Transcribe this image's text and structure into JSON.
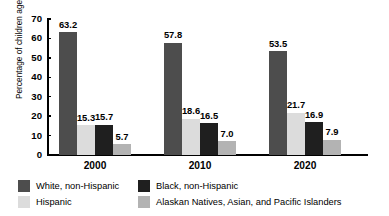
{
  "chart_data": {
    "type": "bar",
    "title": "",
    "xlabel": "",
    "ylabel": "Percentage of children ages 5–17",
    "ylim": [
      0,
      70
    ],
    "ytick_step": 10,
    "yticks": [
      "70",
      "60",
      "50",
      "40",
      "30",
      "20",
      "10",
      "0"
    ],
    "grid": false,
    "legend_position": "bottom",
    "categories": [
      "2000",
      "2010",
      "2020"
    ],
    "series": [
      {
        "name": "White, non-Hispanic",
        "color": "#4d4d4d",
        "values": [
          63.2,
          57.8,
          53.5
        ],
        "labels": [
          "63.2",
          "57.8",
          "53.5"
        ]
      },
      {
        "name": "Hispanic",
        "color": "#dcdcdc",
        "values": [
          15.3,
          18.6,
          21.7
        ],
        "labels": [
          "15.3",
          "18.6",
          "21.7"
        ]
      },
      {
        "name": "Black, non-Hispanic",
        "color": "#1f1f1f",
        "values": [
          15.7,
          16.5,
          16.9
        ],
        "labels": [
          "15.7",
          "16.5",
          "16.9"
        ]
      },
      {
        "name": "Alaskan Natives, Asian, and Pacific Islanders",
        "color": "#b3b3b3",
        "values": [
          5.7,
          7.0,
          7.9
        ],
        "labels": [
          "5.7",
          "7.0",
          "7.9"
        ]
      }
    ]
  },
  "legend": {
    "entries": [
      {
        "label": "White, non-Hispanic",
        "color": "#4d4d4d"
      },
      {
        "label": "Black, non-Hispanic",
        "color": "#1f1f1f"
      },
      {
        "label": "Hispanic",
        "color": "#dcdcdc"
      },
      {
        "label": "Alaskan Natives, Asian, and Pacific Islanders",
        "color": "#b3b3b3"
      }
    ]
  }
}
